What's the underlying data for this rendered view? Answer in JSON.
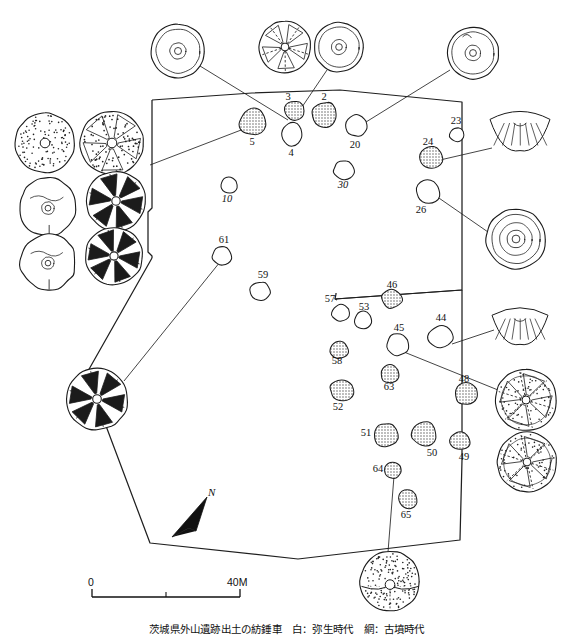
{
  "figure": {
    "caption_main": "茨城県外山遺跡出土の紡錘車",
    "caption_legend_white": "白：弥生時代",
    "caption_legend_hatched": "網：古墳時代",
    "caption_full": "茨城県外山遺跡出土の紡錘車　白：弥生時代　網：古墳時代"
  },
  "scalebar": {
    "start_label": "0",
    "end_label": "40M",
    "x_start": 92,
    "x_end": 240,
    "y": 597
  },
  "north_arrow": {
    "label": "N",
    "x": 205,
    "y": 492
  },
  "colors": {
    "ink": "#1a1a1a",
    "line": "#222222",
    "hatch_fill": "#b9b9b9",
    "white_fill": "#ffffff",
    "paper": "#ffffff"
  },
  "features": [
    {
      "id": "f-3",
      "label": "3",
      "fill": "hatched",
      "cx": 295,
      "cy": 111,
      "w": 19,
      "h": 19,
      "lx": 288,
      "ly": 100
    },
    {
      "id": "f-2",
      "label": "2",
      "fill": "hatched",
      "cx": 325,
      "cy": 114,
      "w": 23,
      "h": 23,
      "lx": 324,
      "ly": 100
    },
    {
      "id": "f-5",
      "label": "5",
      "fill": "hatched",
      "cx": 253,
      "cy": 122,
      "w": 25,
      "h": 24,
      "lx": 252,
      "ly": 145
    },
    {
      "id": "f-4",
      "label": "4",
      "fill": "white",
      "cx": 292,
      "cy": 134,
      "w": 20,
      "h": 21,
      "lx": 291,
      "ly": 156
    },
    {
      "id": "f-20",
      "label": "20",
      "fill": "white",
      "cx": 357,
      "cy": 126,
      "w": 20,
      "h": 20,
      "lx": 355,
      "ly": 148
    },
    {
      "id": "f-23",
      "label": "23",
      "fill": "white",
      "cx": 457,
      "cy": 135,
      "w": 14,
      "h": 13,
      "lx": 456,
      "ly": 124
    },
    {
      "id": "f-24",
      "label": "24",
      "fill": "hatched",
      "cx": 431,
      "cy": 158,
      "w": 22,
      "h": 21,
      "lx": 428,
      "ly": 145
    },
    {
      "id": "f-26",
      "label": "26",
      "fill": "white",
      "cx": 428,
      "cy": 192,
      "w": 22,
      "h": 21,
      "lx": 421,
      "ly": 213
    },
    {
      "id": "f-10",
      "label": "10",
      "fill": "white",
      "cx": 229,
      "cy": 185,
      "w": 16,
      "h": 15,
      "lx": 227,
      "ly": 202
    },
    {
      "id": "f-30",
      "label": "30",
      "fill": "white",
      "cx": 344,
      "cy": 170,
      "w": 19,
      "h": 17,
      "lx": 343,
      "ly": 188
    },
    {
      "id": "f-61",
      "label": "61",
      "fill": "white",
      "cx": 222,
      "cy": 256,
      "w": 18,
      "h": 16,
      "lx": 224,
      "ly": 243
    },
    {
      "id": "f-59",
      "label": "59",
      "fill": "white",
      "cx": 260,
      "cy": 291,
      "w": 19,
      "h": 17,
      "lx": 263,
      "ly": 278
    },
    {
      "id": "f-57",
      "label": "57",
      "fill": "white",
      "cx": 341,
      "cy": 313,
      "w": 17,
      "h": 16,
      "lx": 330,
      "ly": 302
    },
    {
      "id": "f-53",
      "label": "53",
      "fill": "white",
      "cx": 363,
      "cy": 320,
      "w": 16,
      "h": 17,
      "lx": 364,
      "ly": 310
    },
    {
      "id": "f-46",
      "label": "46",
      "fill": "hatched",
      "cx": 392,
      "cy": 299,
      "w": 19,
      "h": 17,
      "lx": 392,
      "ly": 288
    },
    {
      "id": "f-45",
      "label": "45",
      "fill": "white",
      "cx": 398,
      "cy": 345,
      "w": 21,
      "h": 20,
      "lx": 399,
      "ly": 331
    },
    {
      "id": "f-44",
      "label": "44",
      "fill": "white",
      "cx": 441,
      "cy": 337,
      "w": 23,
      "h": 21,
      "lx": 441,
      "ly": 321
    },
    {
      "id": "f-58",
      "label": "58",
      "fill": "hatched",
      "cx": 339,
      "cy": 350,
      "w": 17,
      "h": 16,
      "lx": 337,
      "ly": 364
    },
    {
      "id": "f-63",
      "label": "63",
      "fill": "hatched",
      "cx": 390,
      "cy": 374,
      "w": 17,
      "h": 17,
      "lx": 389,
      "ly": 390
    },
    {
      "id": "f-52",
      "label": "52",
      "fill": "hatched",
      "cx": 342,
      "cy": 390,
      "w": 22,
      "h": 20,
      "lx": 338,
      "ly": 410
    },
    {
      "id": "f-48",
      "label": "48",
      "fill": "hatched",
      "cx": 467,
      "cy": 394,
      "w": 21,
      "h": 21,
      "lx": 464,
      "ly": 382
    },
    {
      "id": "f-51",
      "label": "51",
      "fill": "hatched",
      "cx": 386,
      "cy": 435,
      "w": 23,
      "h": 22,
      "lx": 366,
      "ly": 436
    },
    {
      "id": "f-50",
      "label": "50",
      "fill": "hatched",
      "cx": 424,
      "cy": 434,
      "w": 23,
      "h": 23,
      "lx": 432,
      "ly": 456
    },
    {
      "id": "f-49",
      "label": "49",
      "fill": "hatched",
      "cx": 460,
      "cy": 441,
      "w": 18,
      "h": 17,
      "lx": 464,
      "ly": 460
    },
    {
      "id": "f-64",
      "label": "64",
      "fill": "hatched",
      "cx": 393,
      "cy": 470,
      "w": 16,
      "h": 16,
      "lx": 378,
      "ly": 472
    },
    {
      "id": "f-65",
      "label": "65",
      "fill": "hatched",
      "cx": 408,
      "cy": 499,
      "w": 17,
      "h": 17,
      "lx": 406,
      "ly": 518
    }
  ],
  "artifacts": [
    {
      "id": "a-top-1",
      "name": "whorl-plain-concentric",
      "cx": 178,
      "cy": 51,
      "r": 27,
      "style": "concentric"
    },
    {
      "id": "a-top-2",
      "name": "whorl-radial-dashed",
      "cx": 285,
      "cy": 47,
      "r": 26,
      "style": "radial-dashed"
    },
    {
      "id": "a-top-3",
      "name": "whorl-plain-concentric-2",
      "cx": 339,
      "cy": 47,
      "r": 25,
      "style": "concentric"
    },
    {
      "id": "a-top-4",
      "name": "whorl-disc-notched",
      "cx": 473,
      "cy": 53,
      "r": 26,
      "style": "disc-notched"
    },
    {
      "id": "a-left-1",
      "name": "whorl-stippled",
      "cx": 45,
      "cy": 143,
      "r": 30,
      "style": "stippled"
    },
    {
      "id": "a-left-2",
      "name": "whorl-radial-stippled",
      "cx": 112,
      "cy": 143,
      "r": 32,
      "style": "radial-stippled"
    },
    {
      "id": "a-left-3",
      "name": "whorl-plain-wavy",
      "cx": 48,
      "cy": 207,
      "r": 29,
      "style": "plain-wavy"
    },
    {
      "id": "a-left-4",
      "name": "whorl-radial-blades",
      "cx": 116,
      "cy": 201,
      "r": 30,
      "style": "radial-blades"
    },
    {
      "id": "a-left-5",
      "name": "whorl-plain-wavy-2",
      "cx": 48,
      "cy": 262,
      "r": 28,
      "style": "plain-wavy"
    },
    {
      "id": "a-left-6",
      "name": "whorl-radial-blades-2",
      "cx": 114,
      "cy": 256,
      "r": 29,
      "style": "radial-blades"
    },
    {
      "id": "a-left-7",
      "name": "whorl-radial-blades-3",
      "cx": 97,
      "cy": 399,
      "r": 31,
      "style": "radial-blades"
    },
    {
      "id": "a-right-1",
      "name": "whorl-fan-fragment",
      "cx": 520,
      "cy": 132,
      "r": 30,
      "style": "fan-fragment"
    },
    {
      "id": "a-right-2",
      "name": "whorl-concentric-large",
      "cx": 516,
      "cy": 239,
      "r": 30,
      "style": "concentric-large"
    },
    {
      "id": "a-right-3",
      "name": "whorl-fan-fragment-2",
      "cx": 520,
      "cy": 327,
      "r": 28,
      "style": "fan-fragment"
    },
    {
      "id": "a-right-4",
      "name": "whorl-radial-dotted",
      "cx": 526,
      "cy": 400,
      "r": 31,
      "style": "radial-dotted"
    },
    {
      "id": "a-right-5",
      "name": "whorl-radial-dotted-2",
      "cx": 527,
      "cy": 462,
      "r": 30,
      "style": "radial-dotted"
    },
    {
      "id": "a-bot-1",
      "name": "whorl-stippled-bottom",
      "cx": 390,
      "cy": 581,
      "r": 30,
      "style": "stippled-bottom"
    }
  ],
  "leader_lines": [
    {
      "id": "ll-1",
      "from": "a-top-1",
      "x1": 200,
      "y1": 66,
      "x2": 288,
      "y2": 120
    },
    {
      "id": "ll-2",
      "from": "a-top-3",
      "x1": 327,
      "y1": 70,
      "x2": 300,
      "y2": 110
    },
    {
      "id": "ll-3",
      "from": "a-top-4",
      "x1": 450,
      "y1": 70,
      "x2": 366,
      "y2": 122
    },
    {
      "id": "ll-4",
      "from": "a-left-2",
      "x1": 150,
      "y1": 165,
      "x2": 262,
      "y2": 122
    },
    {
      "id": "ll-5",
      "from": "a-right-1",
      "x1": 492,
      "y1": 148,
      "x2": 440,
      "y2": 160
    },
    {
      "id": "ll-6",
      "from": "a-right-2",
      "x1": 488,
      "y1": 232,
      "x2": 436,
      "y2": 196
    },
    {
      "id": "ll-7",
      "from": "a-left-7",
      "x1": 124,
      "y1": 381,
      "x2": 220,
      "y2": 262
    },
    {
      "id": "ll-8",
      "from": "a-right-3",
      "x1": 494,
      "y1": 330,
      "x2": 452,
      "y2": 344
    },
    {
      "id": "ll-9",
      "from": "a-right-4",
      "x1": 498,
      "y1": 390,
      "x2": 404,
      "y2": 352
    },
    {
      "id": "ll-10",
      "from": "a-bot-1",
      "x1": 388,
      "y1": 552,
      "x2": 394,
      "y2": 476
    }
  ]
}
